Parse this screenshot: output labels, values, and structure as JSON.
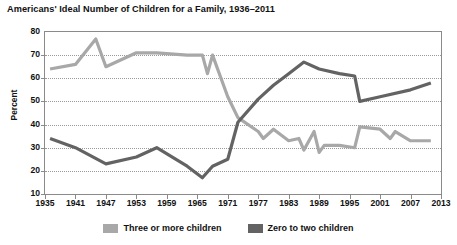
{
  "chart_data": {
    "type": "line",
    "title": "Americans' Ideal Number of Children for a Family, 1936–2011",
    "xlabel": "",
    "ylabel": "Percent",
    "ylim": [
      10,
      80
    ],
    "ytick_step": 10,
    "yticks": [
      80,
      70,
      60,
      50,
      40,
      30,
      20,
      10
    ],
    "xlim": [
      1935,
      2013
    ],
    "xticks": [
      1935,
      1941,
      1947,
      1953,
      1959,
      1965,
      1971,
      1977,
      1983,
      1989,
      1995,
      2001,
      2007,
      2013
    ],
    "grid": "horizontal-dotted",
    "legend_position": "bottom-center",
    "series": [
      {
        "name": "Three or more children",
        "color": "#a8a8a8",
        "points": [
          [
            1936,
            64
          ],
          [
            1941,
            66
          ],
          [
            1945,
            77
          ],
          [
            1947,
            65
          ],
          [
            1953,
            71
          ],
          [
            1957,
            71
          ],
          [
            1963,
            70
          ],
          [
            1966,
            70
          ],
          [
            1967,
            62
          ],
          [
            1968,
            70
          ],
          [
            1971,
            52
          ],
          [
            1973,
            43
          ],
          [
            1977,
            37
          ],
          [
            1978,
            34
          ],
          [
            1980,
            38
          ],
          [
            1983,
            33
          ],
          [
            1985,
            34
          ],
          [
            1986,
            29
          ],
          [
            1988,
            37
          ],
          [
            1989,
            28
          ],
          [
            1990,
            31
          ],
          [
            1993,
            31
          ],
          [
            1996,
            30
          ],
          [
            1997,
            39
          ],
          [
            2001,
            38
          ],
          [
            2003,
            34
          ],
          [
            2004,
            37
          ],
          [
            2007,
            33
          ],
          [
            2011,
            33
          ]
        ]
      },
      {
        "name": "Zero to two children",
        "color": "#636363",
        "points": [
          [
            1936,
            34
          ],
          [
            1941,
            30
          ],
          [
            1947,
            23
          ],
          [
            1953,
            26
          ],
          [
            1957,
            30
          ],
          [
            1963,
            22
          ],
          [
            1966,
            17
          ],
          [
            1968,
            22
          ],
          [
            1971,
            25
          ],
          [
            1973,
            41
          ],
          [
            1977,
            51
          ],
          [
            1980,
            57
          ],
          [
            1983,
            62
          ],
          [
            1986,
            67
          ],
          [
            1989,
            64
          ],
          [
            1993,
            62
          ],
          [
            1996,
            61
          ],
          [
            1997,
            50
          ],
          [
            2001,
            52
          ],
          [
            2007,
            55
          ],
          [
            2011,
            58
          ]
        ]
      }
    ]
  },
  "legend": {
    "items": [
      {
        "label": "Three or more children",
        "color": "#a8a8a8"
      },
      {
        "label": "Zero to two children",
        "color": "#636363"
      }
    ]
  }
}
